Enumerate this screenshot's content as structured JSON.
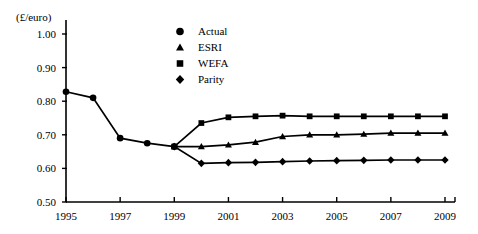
{
  "chart_data": {
    "type": "line",
    "title": "",
    "subtitle": "",
    "xlabel": "",
    "ylabel": "(£/euro)",
    "ylim": [
      0.5,
      1.0
    ],
    "ytick_step": 0.1,
    "xlim": [
      1995,
      2009
    ],
    "xtick_step": 2,
    "grid": false,
    "legend_position": "top-center",
    "yticks": [
      "1.00",
      "0.90",
      "0.80",
      "0.70",
      "0.60",
      "0.50"
    ],
    "ytick_values": [
      1.0,
      0.9,
      0.8,
      0.7,
      0.6,
      0.5
    ],
    "xticks": [
      "1995",
      "1997",
      "1999",
      "2001",
      "2003",
      "2005",
      "2007",
      "2009"
    ],
    "xtick_values": [
      1995,
      1997,
      1999,
      2001,
      2003,
      2005,
      2007,
      2009
    ],
    "x": [
      1995,
      1996,
      1997,
      1998,
      1999,
      2000,
      2001,
      2002,
      2003,
      2004,
      2005,
      2006,
      2007,
      2008,
      2009
    ],
    "series": [
      {
        "name": "Actual",
        "marker": "circle",
        "color": "#000000",
        "x": [
          1995,
          1996,
          1997,
          1998,
          1999
        ],
        "values": [
          0.828,
          0.81,
          0.69,
          0.675,
          0.665
        ]
      },
      {
        "name": "ESRI",
        "marker": "triangle",
        "color": "#000000",
        "x": [
          1999,
          2000,
          2001,
          2002,
          2003,
          2004,
          2005,
          2006,
          2007,
          2008,
          2009
        ],
        "values": [
          0.665,
          0.665,
          0.67,
          0.678,
          0.695,
          0.7,
          0.7,
          0.702,
          0.705,
          0.705,
          0.705
        ]
      },
      {
        "name": "WEFA",
        "marker": "square",
        "color": "#000000",
        "x": [
          1999,
          2000,
          2001,
          2002,
          2003,
          2004,
          2005,
          2006,
          2007,
          2008,
          2009
        ],
        "values": [
          0.665,
          0.735,
          0.752,
          0.755,
          0.757,
          0.755,
          0.755,
          0.755,
          0.755,
          0.755,
          0.755
        ]
      },
      {
        "name": "Parity",
        "marker": "diamond",
        "color": "#000000",
        "x": [
          1999,
          2000,
          2001,
          2002,
          2003,
          2004,
          2005,
          2006,
          2007,
          2008,
          2009
        ],
        "values": [
          0.665,
          0.615,
          0.617,
          0.618,
          0.62,
          0.622,
          0.623,
          0.624,
          0.625,
          0.625,
          0.625
        ]
      }
    ],
    "legend": [
      {
        "label": "Actual",
        "marker": "circle"
      },
      {
        "label": "ESRI",
        "marker": "triangle"
      },
      {
        "label": "WEFA",
        "marker": "square"
      },
      {
        "label": "Parity",
        "marker": "diamond"
      }
    ]
  },
  "axis": {
    "y_axis_title": "(£/euro)"
  }
}
